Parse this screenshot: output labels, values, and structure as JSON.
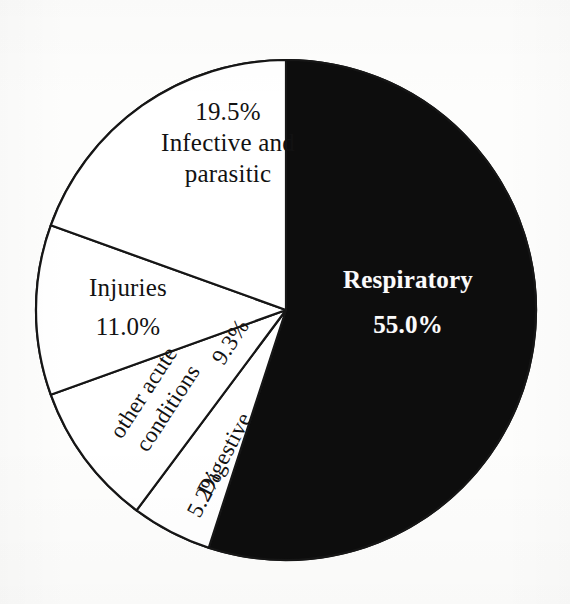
{
  "chart_data": {
    "type": "pie",
    "title": "",
    "subtitle": "",
    "xlabel": "",
    "ylabel": "",
    "legend_position": "none",
    "grid": false,
    "value_unit": "percent",
    "total": 100.0,
    "start_angle_deg_from_top": 0,
    "direction": "clockwise",
    "categories": [
      "Respiratory",
      "Digestive",
      "other acute conditions",
      "Injuries",
      "Infective and parasitic"
    ],
    "values": [
      55.0,
      5.2,
      9.3,
      11.0,
      19.5
    ],
    "slices": [
      {
        "name": "Respiratory",
        "label_line1": "Respiratory",
        "label_line2": "55.0%",
        "value": 55.0,
        "percent_text": "55.0%",
        "fill": "#0d0d0d",
        "text_color": "#fbfbfb",
        "label_placement": "inside",
        "label_rotation_deg": 0
      },
      {
        "name": "Digestive",
        "label_line1": "Digestive",
        "label_line2": "5.2%",
        "value": 5.2,
        "percent_text": "5.2%",
        "fill": "#ffffff",
        "text_color": "#121212",
        "label_placement": "inside",
        "label_rotation_deg": -62
      },
      {
        "name": "other acute conditions",
        "label_line1": "other acute",
        "label_line2": "conditions",
        "label_line3": "9.3%",
        "value": 9.3,
        "percent_text": "9.3%",
        "fill": "#ffffff",
        "text_color": "#121212",
        "label_placement": "inside",
        "label_rotation_deg": -57
      },
      {
        "name": "Injuries",
        "label_line1": "Injuries",
        "label_line2": "11.0%",
        "value": 11.0,
        "percent_text": "11.0%",
        "fill": "#ffffff",
        "text_color": "#121212",
        "label_placement": "inside",
        "label_rotation_deg": 0
      },
      {
        "name": "Infective and parasitic",
        "label_line1": "19.5%",
        "label_line2": "Infective and",
        "label_line3": "parasitic",
        "value": 19.5,
        "percent_text": "19.5%",
        "fill": "#ffffff",
        "text_color": "#121212",
        "label_placement": "inside",
        "label_rotation_deg": 0
      }
    ],
    "colors": {
      "highlight_slice": "#0d0d0d",
      "other_slices": "#ffffff",
      "outline": "#161616",
      "background": "#fdfdfc"
    }
  },
  "figure": {
    "center_x": 286,
    "center_y": 310,
    "radius": 250,
    "outline_width_px": 2.2
  }
}
